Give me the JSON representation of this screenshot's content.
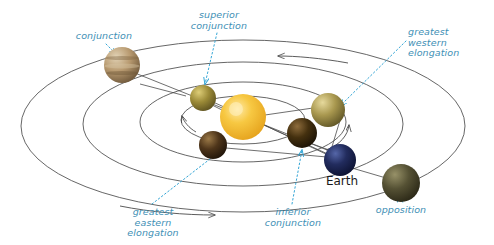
{
  "figure": {
    "type": "astronomy-diagram",
    "background_color": "#ffffff",
    "label_color": "#3e8fb5",
    "orbit_color": "#4a4a4a",
    "leader_color": "#35a6d6",
    "earth_label_color": "#1a1a1a"
  },
  "labels": {
    "conjunction": "conjunction",
    "superior_conjunction": "superior\nconjunction",
    "greatest_western_elongation": "greatest\nwestern\nelongation",
    "greatest_eastern_elongation": "greatest\neastern\nelongation",
    "inferior_conjunction": "inferior\nconjunction",
    "opposition": "opposition",
    "earth": "Earth"
  },
  "bodies": [
    {
      "name": "sun",
      "cx": 243,
      "cy": 117,
      "r": 23,
      "color": "#f0b429",
      "highlight": "#ffe9a8"
    },
    {
      "name": "earth",
      "cx": 340,
      "cy": 160,
      "r": 16,
      "color": "#1b2350",
      "highlight": "#4a5a96"
    },
    {
      "name": "planet-conjunction",
      "cx": 122,
      "cy": 65,
      "r": 18,
      "color": "#a98b62",
      "highlight": "#ded0b4"
    },
    {
      "name": "planet-superior-conjunction",
      "cx": 203,
      "cy": 98,
      "r": 13,
      "color": "#8a7a33",
      "highlight": "#d8c976"
    },
    {
      "name": "planet-greatest-western",
      "cx": 328,
      "cy": 110,
      "r": 17,
      "color": "#9a8a4a",
      "highlight": "#e2d59a"
    },
    {
      "name": "planet-greatest-eastern",
      "cx": 213,
      "cy": 145,
      "r": 14,
      "color": "#4a3218",
      "highlight": "#9a7b4a"
    },
    {
      "name": "planet-inferior-conjunction",
      "cx": 302,
      "cy": 133,
      "r": 15,
      "color": "#3f2c16",
      "highlight": "#8c6a3e"
    },
    {
      "name": "planet-opposition",
      "cx": 401,
      "cy": 183,
      "r": 19,
      "color": "#4a4630",
      "highlight": "#8f8a66"
    }
  ],
  "orbits": [
    {
      "name": "orbit-innermost",
      "cx": 243,
      "cy": 120,
      "rx": 62,
      "ry": 24
    },
    {
      "name": "orbit-inner",
      "cx": 243,
      "cy": 122,
      "rx": 103,
      "ry": 40
    },
    {
      "name": "orbit-middle",
      "cx": 243,
      "cy": 124,
      "rx": 160,
      "ry": 62
    },
    {
      "name": "orbit-outer",
      "cx": 243,
      "cy": 126,
      "rx": 222,
      "ry": 86
    }
  ],
  "label_positions": {
    "conjunction": {
      "x": 62,
      "y": 31,
      "w": 84,
      "align": "center"
    },
    "superior_conjunction": {
      "x": 186,
      "y": 10,
      "w": 66,
      "align": "center"
    },
    "greatest_western_elongation": {
      "x": 408,
      "y": 27,
      "w": 76,
      "align": "left"
    },
    "greatest_eastern_elongation": {
      "x": 112,
      "y": 207,
      "w": 82,
      "align": "center"
    },
    "inferior_conjunction": {
      "x": 253,
      "y": 207,
      "w": 80,
      "align": "center"
    },
    "opposition": {
      "x": 368,
      "y": 205,
      "w": 66,
      "align": "center"
    },
    "earth": {
      "x": 313,
      "y": 174,
      "w": 58,
      "align": "center"
    }
  }
}
